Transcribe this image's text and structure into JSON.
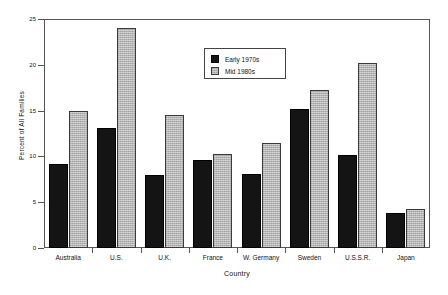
{
  "chart_data": {
    "type": "bar",
    "title": "",
    "xlabel": "Country",
    "ylabel": "Percent of All Families",
    "ylim": [
      0,
      25
    ],
    "yticks": [
      0,
      5,
      10,
      15,
      20,
      25
    ],
    "grid": false,
    "legend_position": "top-center",
    "categories": [
      "Australia",
      "U.S.",
      "U.K.",
      "France",
      "W. Germany",
      "Sweden",
      "U.S.S.R.",
      "Japan"
    ],
    "series": [
      {
        "name": "Early 1970s",
        "color": "#141414",
        "values": [
          9.2,
          13.1,
          8.0,
          9.6,
          8.1,
          15.2,
          10.1,
          3.8
        ]
      },
      {
        "name": "Mid 1980s",
        "color": "#b6b6b6",
        "values": [
          15.0,
          24.0,
          14.5,
          10.3,
          11.5,
          17.2,
          20.2,
          4.3
        ]
      }
    ]
  },
  "legend": {
    "items": [
      {
        "label": "Early 1970s",
        "swatch": "early"
      },
      {
        "label": "Mid 1980s",
        "swatch": "mid"
      }
    ]
  }
}
